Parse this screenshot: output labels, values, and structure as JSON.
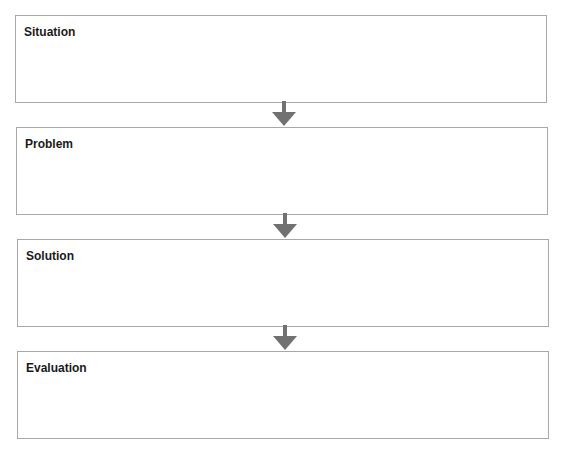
{
  "diagram": {
    "type": "flowchart",
    "direction": "top-to-bottom",
    "steps": [
      {
        "label": "Situation"
      },
      {
        "label": "Problem"
      },
      {
        "label": "Solution"
      },
      {
        "label": "Evaluation"
      }
    ],
    "connectors": [
      {
        "from": "Situation",
        "to": "Problem",
        "icon": "arrow-down-icon"
      },
      {
        "from": "Problem",
        "to": "Solution",
        "icon": "arrow-down-icon"
      },
      {
        "from": "Solution",
        "to": "Evaluation",
        "icon": "arrow-down-icon"
      }
    ],
    "colors": {
      "box_border": "#a9a9a9",
      "arrow": "#717171",
      "text": "#1a1a1a"
    }
  }
}
